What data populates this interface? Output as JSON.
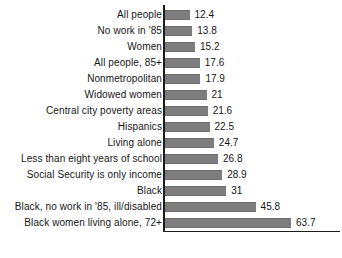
{
  "chart_data": {
    "type": "bar",
    "orientation": "horizontal",
    "title": "",
    "subtitle": "",
    "xlabel": "",
    "ylabel": "",
    "grid": false,
    "legend": false,
    "legend_position": "none",
    "xlim": [
      0,
      70
    ],
    "value_suffix": "",
    "bar_color": "#7d7d7d",
    "axis_color": "#1c1c1c",
    "background_color": "#ffffff",
    "categories": [
      "All people",
      "No work in '85",
      "Women",
      "All people, 85+",
      "Nonmetropolitan",
      "Widowed women",
      "Central city poverty areas",
      "Hispanics",
      "Living alone",
      "Less than eight years of school",
      "Social Security is only income",
      "Black",
      "Black, no work in '85, ill/disabled",
      "Black women living alone, 72+"
    ],
    "values": [
      12.4,
      13.8,
      15.2,
      17.6,
      17.9,
      21,
      21.6,
      22.5,
      24.7,
      26.8,
      28.9,
      31,
      45.8,
      63.7
    ],
    "value_labels": [
      "12.4",
      "13.8",
      "15.2",
      "17.6",
      "17.9",
      "21",
      "21.6",
      "22.5",
      "24.7",
      "26.8",
      "28.9",
      "31",
      "45.8",
      "63.7"
    ]
  }
}
